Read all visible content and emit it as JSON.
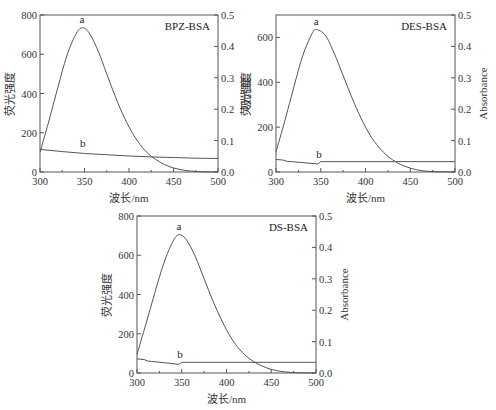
{
  "chart_data": [
    {
      "type": "line",
      "title": "BPZ-BSA",
      "xlabel": "波长/nm",
      "ylabel_left": "荧光强度",
      "ylabel_right": "吸光度",
      "xlim": [
        300,
        500
      ],
      "ylim_left": [
        0,
        800
      ],
      "ylim_right": [
        0,
        0.5
      ],
      "x_ticks": [
        "300",
        "350",
        "400",
        "450",
        "500"
      ],
      "y_ticks_left": [
        "0",
        "200",
        "400",
        "600",
        "800"
      ],
      "y_ticks_right": [
        "0.0",
        "0.1",
        "0.2",
        "0.3",
        "0.4",
        "0.5"
      ],
      "grid": false,
      "series": [
        {
          "name": "a",
          "axis": "left",
          "label": "a",
          "x": [
            300,
            310,
            320,
            330,
            340,
            347,
            355,
            365,
            375,
            385,
            395,
            405,
            415,
            425,
            435,
            445,
            455,
            465,
            475,
            485,
            500
          ],
          "y": [
            100,
            260,
            430,
            590,
            700,
            735,
            710,
            620,
            500,
            380,
            275,
            190,
            125,
            80,
            50,
            28,
            15,
            7,
            3,
            1,
            0
          ]
        },
        {
          "name": "b",
          "axis": "right",
          "label": "b",
          "x": [
            300,
            325,
            350,
            375,
            400,
            425,
            450,
            475,
            500
          ],
          "y": [
            0.072,
            0.065,
            0.059,
            0.055,
            0.051,
            0.048,
            0.046,
            0.044,
            0.043
          ]
        }
      ]
    },
    {
      "type": "line",
      "title": "DES-BSA",
      "xlabel": "波长/nm",
      "ylabel_left": "荧光强度",
      "ylabel_right": "Absorbance",
      "xlim": [
        300,
        500
      ],
      "ylim_left": [
        0,
        700
      ],
      "ylim_right": [
        0,
        0.5
      ],
      "x_ticks": [
        "300",
        "350",
        "400",
        "450",
        "500"
      ],
      "y_ticks_left": [
        "0",
        "200",
        "400",
        "600"
      ],
      "y_ticks_right": [
        "0.0",
        "0.1",
        "0.2",
        "0.3",
        "0.4",
        "0.5"
      ],
      "grid": false,
      "series": [
        {
          "name": "a",
          "axis": "left",
          "label": "a",
          "x": [
            300,
            310,
            320,
            330,
            340,
            345,
            355,
            365,
            375,
            385,
            395,
            405,
            415,
            425,
            435,
            445,
            455,
            465,
            475,
            485,
            500
          ],
          "y": [
            90,
            230,
            380,
            520,
            615,
            635,
            610,
            530,
            430,
            330,
            240,
            165,
            110,
            70,
            42,
            24,
            12,
            5,
            2,
            1,
            0
          ]
        },
        {
          "name": "b",
          "axis": "right",
          "label": "b",
          "x": [
            300,
            308,
            312,
            330,
            345,
            347,
            350,
            375,
            400,
            450,
            500
          ],
          "y": [
            0.04,
            0.038,
            0.034,
            0.03,
            0.026,
            0.026,
            0.033,
            0.033,
            0.033,
            0.033,
            0.033
          ]
        }
      ]
    },
    {
      "type": "line",
      "title": "DS-BSA",
      "xlabel": "波长/nm",
      "ylabel_left": "荧光强度",
      "ylabel_right": "Absorbance",
      "xlim": [
        300,
        500
      ],
      "ylim_left": [
        0,
        800
      ],
      "ylim_right": [
        0,
        0.5
      ],
      "x_ticks": [
        "300",
        "350",
        "400",
        "450",
        "500"
      ],
      "y_ticks_left": [
        "0",
        "200",
        "400",
        "600",
        "800"
      ],
      "y_ticks_right": [
        "0.0",
        "0.1",
        "0.2",
        "0.3",
        "0.4",
        "0.5"
      ],
      "grid": false,
      "series": [
        {
          "name": "a",
          "axis": "left",
          "label": "a",
          "x": [
            300,
            310,
            320,
            330,
            340,
            347,
            355,
            365,
            375,
            385,
            395,
            405,
            415,
            425,
            435,
            445,
            455,
            465,
            475,
            485,
            500
          ],
          "y": [
            95,
            250,
            410,
            560,
            670,
            705,
            680,
            595,
            480,
            365,
            265,
            180,
            118,
            75,
            46,
            26,
            13,
            6,
            2,
            1,
            0
          ]
        },
        {
          "name": "b",
          "axis": "right",
          "label": "b",
          "x": [
            300,
            308,
            312,
            330,
            345,
            347,
            350,
            375,
            400,
            450,
            500
          ],
          "y": [
            0.045,
            0.043,
            0.038,
            0.033,
            0.028,
            0.028,
            0.034,
            0.034,
            0.034,
            0.034,
            0.034
          ]
        }
      ]
    }
  ],
  "layout": [
    {
      "x0": 40,
      "x1": 218,
      "y0": 15,
      "y1": 172
    },
    {
      "x0": 276,
      "x1": 455,
      "y0": 15,
      "y1": 172
    },
    {
      "x0": 137,
      "x1": 316,
      "y0": 216,
      "y1": 373
    }
  ],
  "colors": {
    "curve": "#555555",
    "frame": "#555555",
    "text": "#333333"
  }
}
